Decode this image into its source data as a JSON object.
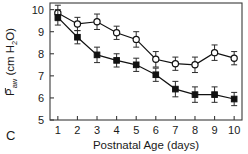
{
  "panel": {
    "label": "C"
  },
  "axes": {
    "x": {
      "title": "Postnatal Age (days)",
      "ticks": [
        "1",
        "2",
        "3",
        "4",
        "5",
        "6",
        "7",
        "8",
        "9",
        "10"
      ],
      "range": [
        0.6,
        10.4
      ]
    },
    "y": {
      "title_parts": {
        "symbol": "P",
        "subscript": "aw",
        "units": "(cm H",
        "units_sub": "2",
        "units_end": "O)"
      },
      "title": "Paw (cm H2O)",
      "ticks": [
        "5",
        "6",
        "7",
        "8",
        "9",
        "10"
      ],
      "range": [
        5,
        10.3
      ]
    }
  },
  "chart_data": {
    "type": "line",
    "title": "",
    "xlabel": "Postnatal Age (days)",
    "ylabel": "P̄aw (cm H2O)",
    "xlim": [
      0.6,
      10.4
    ],
    "ylim": [
      5,
      10.3
    ],
    "grid": false,
    "legend": "none",
    "x": [
      1,
      2,
      3,
      4,
      5,
      6,
      7,
      8,
      9,
      10
    ],
    "series": [
      {
        "name": "open-circle-group",
        "marker": "open-circle",
        "values": [
          9.85,
          9.35,
          9.45,
          8.95,
          8.65,
          7.75,
          7.55,
          7.5,
          8.05,
          7.8
        ],
        "errors": [
          0.35,
          0.3,
          0.35,
          0.3,
          0.35,
          0.35,
          0.3,
          0.35,
          0.35,
          0.3
        ]
      },
      {
        "name": "filled-square-group",
        "marker": "filled-square",
        "values": [
          9.65,
          8.75,
          7.95,
          7.7,
          7.5,
          7.05,
          6.4,
          6.15,
          6.15,
          5.95
        ],
        "errors": [
          0.35,
          0.3,
          0.35,
          0.3,
          0.3,
          0.3,
          0.35,
          0.35,
          0.35,
          0.3
        ]
      }
    ]
  },
  "colors": {
    "axis": "#3a3a3a",
    "line": "#111111",
    "marker_fill_open": "#ffffff",
    "marker_fill_closed": "#111111",
    "background": "#ffffff"
  }
}
